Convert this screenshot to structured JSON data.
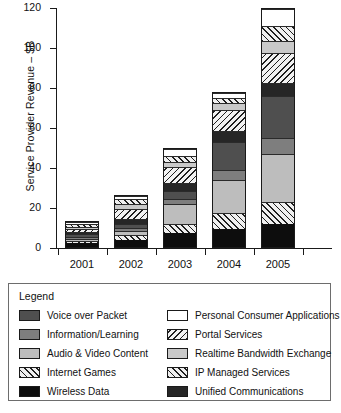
{
  "chart_data": {
    "type": "bar",
    "subtype": "stacked-bar",
    "title": "",
    "xlabel": "",
    "ylabel": "Service Provider Revenue – $B",
    "categories": [
      "2001",
      "2002",
      "2003",
      "2004",
      "2005"
    ],
    "ylim": [
      0,
      120
    ],
    "yticks": [
      0,
      20,
      40,
      60,
      80,
      100,
      120
    ],
    "ytick_labels": [
      "0",
      "20",
      "40",
      "60",
      "80",
      "100",
      "120"
    ],
    "grid": false,
    "legend_position": "below-plot",
    "legend_title": "Legend",
    "totals": [
      13.5,
      26.5,
      50.0,
      78.0,
      113.0
    ],
    "series": [
      {
        "name": "Wireless Data",
        "swatch": "black",
        "values": [
          2.0,
          3.5,
          7.0,
          9.0,
          11.5
        ]
      },
      {
        "name": "IP Managed Services",
        "swatch": "hatch-fwd",
        "values": [
          1.0,
          3.0,
          4.5,
          8.0,
          11.0
        ]
      },
      {
        "name": "Audio & Video Content",
        "swatch": "lightgray",
        "values": [
          1.5,
          2.0,
          10.5,
          17.0,
          24.5
        ]
      },
      {
        "name": "Information/Learning",
        "swatch": "midgray",
        "values": [
          1.0,
          1.5,
          2.5,
          5.0,
          8.0
        ]
      },
      {
        "name": "Voice over Packet",
        "swatch": "darkgray",
        "values": [
          1.5,
          2.0,
          4.0,
          14.0,
          21.0
        ]
      },
      {
        "name": "Unified Communications",
        "swatch": "near-black",
        "values": [
          1.0,
          2.5,
          4.0,
          6.0,
          6.5
        ]
      },
      {
        "name": "Portal Services",
        "swatch": "hatch-back",
        "values": [
          1.5,
          5.5,
          8.5,
          10.5,
          15.5
        ]
      },
      {
        "name": "Realtime Bandwidth Exchange",
        "swatch": "lightgray2",
        "values": [
          1.5,
          2.5,
          2.5,
          3.5,
          6.0
        ]
      },
      {
        "name": "Internet Games",
        "swatch": "hatch-fwd",
        "values": [
          1.5,
          2.5,
          3.0,
          2.5,
          7.5
        ]
      },
      {
        "name": "Personal Consumer Applications",
        "swatch": "white",
        "values": [
          1.0,
          1.5,
          3.5,
          2.5,
          8.5
        ]
      }
    ]
  },
  "axis": {
    "y_title": "Service Provider Revenue – $B",
    "y_tick_labels": [
      "0",
      "20",
      "40",
      "60",
      "80",
      "100",
      "120"
    ],
    "x_tick_labels": [
      "2001",
      "2002",
      "2003",
      "2004",
      "2005"
    ]
  },
  "legend": {
    "title": "Legend",
    "left_column": [
      {
        "label": "Voice over Packet",
        "swatch": "darkgray"
      },
      {
        "label": "Information/Learning",
        "swatch": "midgray"
      },
      {
        "label": "Audio & Video Content",
        "swatch": "lightgray"
      },
      {
        "label": "Internet Games",
        "swatch": "hatch-fwd"
      },
      {
        "label": "Wireless Data",
        "swatch": "black"
      }
    ],
    "right_column": [
      {
        "label": "Personal Consumer Applications",
        "swatch": "white"
      },
      {
        "label": "Portal Services",
        "swatch": "hatch-back"
      },
      {
        "label": "Realtime Bandwidth Exchange",
        "swatch": "lightgray2"
      },
      {
        "label": "IP Managed Services",
        "swatch": "hatch-fwd"
      },
      {
        "label": "Unified Communications",
        "swatch": "near-black"
      }
    ]
  },
  "colors": {
    "black": "#0d0d0d",
    "near_black": "#262626",
    "darkgray": "#4f4f4f",
    "midgray": "#7e7e7e",
    "lightgray": "#bdbdbd",
    "lightgray2": "#c9c9c9",
    "white": "#ffffff",
    "axis": "#1a1a1a",
    "legend_border": "#6d6d6d"
  }
}
